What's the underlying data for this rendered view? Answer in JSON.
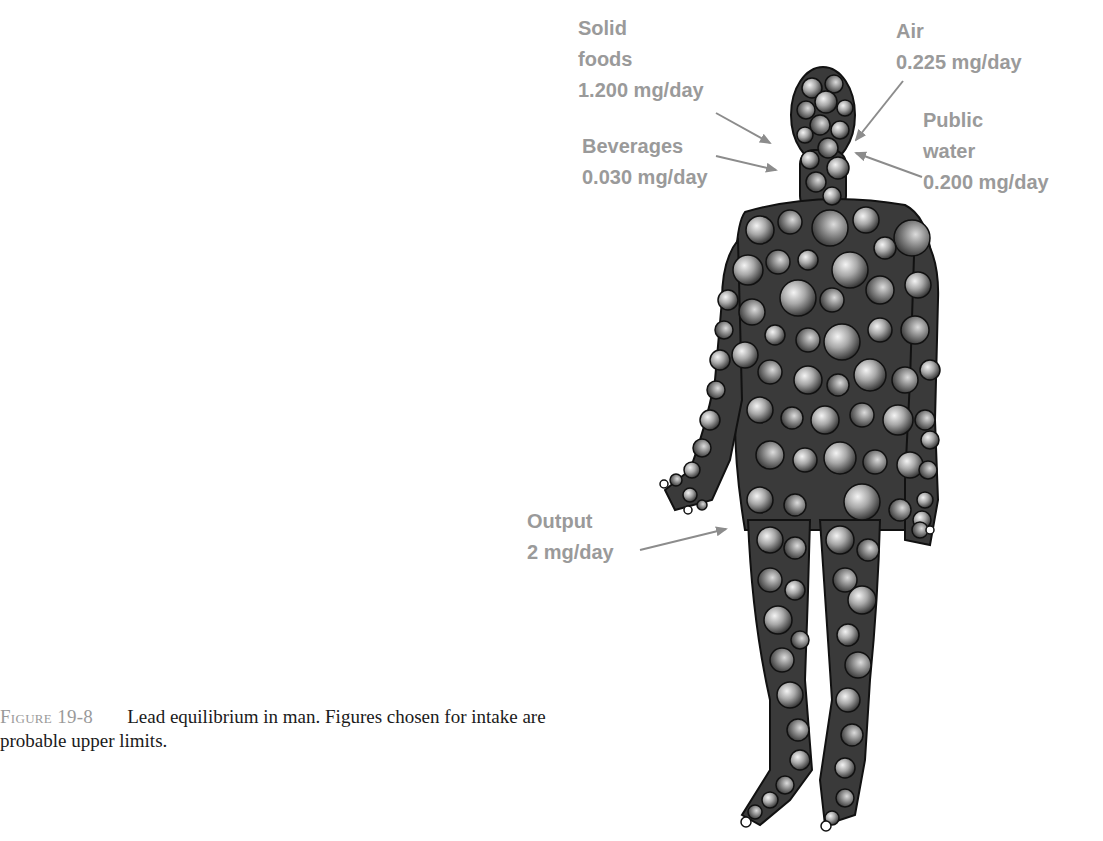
{
  "figure": {
    "number": "Figure 19-8",
    "caption": "Lead equilibrium in man. Figures chosen for intake are probable upper limits."
  },
  "labels": {
    "solid_foods": {
      "line1": "Solid",
      "line2": "foods",
      "value": "1.200 mg/day"
    },
    "beverages": {
      "line1": "Beverages",
      "value": "0.030 mg/day"
    },
    "air": {
      "line1": "Air",
      "value": "0.225 mg/day"
    },
    "public_water": {
      "line1": "Public",
      "line2": "water",
      "value": "0.200 mg/day"
    },
    "output": {
      "line1": "Output",
      "value": "2 mg/day"
    }
  },
  "colors": {
    "label_gray": "#9a9a9a",
    "arrow_gray": "#8c8c8c",
    "body_outline": "#111111"
  }
}
